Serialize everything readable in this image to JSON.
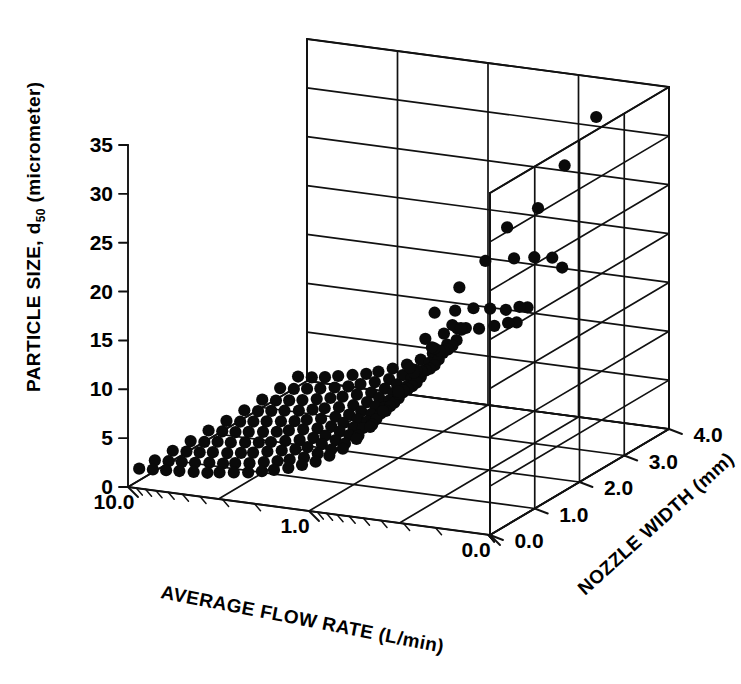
{
  "figure": {
    "background_color": "#ffffff",
    "ink_color": "#000000",
    "marker_color": "#0a0a0a"
  },
  "chart_data": {
    "type": "scatter",
    "projection": "3d",
    "title": "",
    "subtitle": "",
    "xlabel": "AVERAGE FLOW RATE (L/min)",
    "ylabel": "NOZZLE WIDTH (mm)",
    "zlabel_parts": {
      "prefix": "PARTICLE SIZE, d",
      "subscript": "50",
      "suffix": " (micrometer)"
    },
    "zlabel": "PARTICLE SIZE, d50 (micrometer)",
    "xscale": "log",
    "yscale": "linear",
    "zscale": "linear",
    "xlim": [
      0.0,
      10.0
    ],
    "ylim": [
      0.0,
      4.0
    ],
    "zlim": [
      0,
      35
    ],
    "xticks": [
      "10.0",
      "1.0",
      "0.0"
    ],
    "xtick_values": [
      10.0,
      1.0,
      0.0
    ],
    "yticks": [
      "0.0",
      "1.0",
      "2.0",
      "3.0",
      "4.0"
    ],
    "ytick_values": [
      0.0,
      1.0,
      2.0,
      3.0,
      4.0
    ],
    "zticks": [
      "0",
      "5",
      "10",
      "15",
      "20",
      "25",
      "30",
      "35"
    ],
    "ztick_values": [
      0,
      5,
      10,
      15,
      20,
      25,
      30,
      35
    ],
    "grid": true,
    "legend": "none",
    "annotations": [],
    "series": [
      {
        "name": "measured particle size",
        "marker": "filled-circle",
        "color": "#0a0a0a",
        "note": "Particle size d50 rises sharply as average flow rate decreases; spread increases with lower flow rate and varies with nozzle width.",
        "points": [
          {
            "x": 10.0,
            "y": 0.25,
            "z": 1.2
          },
          {
            "x": 8.4,
            "y": 0.25,
            "z": 1.3
          },
          {
            "x": 7.1,
            "y": 0.25,
            "z": 1.4
          },
          {
            "x": 6.0,
            "y": 0.25,
            "z": 1.5
          },
          {
            "x": 5.0,
            "y": 0.25,
            "z": 1.6
          },
          {
            "x": 4.2,
            "y": 0.25,
            "z": 1.7
          },
          {
            "x": 3.6,
            "y": 0.25,
            "z": 1.9
          },
          {
            "x": 3.0,
            "y": 0.25,
            "z": 2.1
          },
          {
            "x": 2.5,
            "y": 0.25,
            "z": 2.3
          },
          {
            "x": 2.1,
            "y": 0.25,
            "z": 2.6
          },
          {
            "x": 1.8,
            "y": 0.25,
            "z": 2.9
          },
          {
            "x": 1.5,
            "y": 0.25,
            "z": 3.3
          },
          {
            "x": 1.26,
            "y": 0.25,
            "z": 3.8
          },
          {
            "x": 1.06,
            "y": 0.25,
            "z": 4.3
          },
          {
            "x": 0.89,
            "y": 0.25,
            "z": 5.1
          },
          {
            "x": 0.75,
            "y": 0.25,
            "z": 6.0
          },
          {
            "x": 0.63,
            "y": 0.25,
            "z": 7.2
          },
          {
            "x": 0.53,
            "y": 0.25,
            "z": 8.6
          },
          {
            "x": 0.45,
            "y": 0.25,
            "z": 10.4
          },
          {
            "x": 0.37,
            "y": 0.25,
            "z": 12.6
          },
          {
            "x": 0.32,
            "y": 0.25,
            "z": 15.2
          },
          {
            "x": 10.0,
            "y": 0.6,
            "z": 1.1
          },
          {
            "x": 8.4,
            "y": 0.6,
            "z": 1.2
          },
          {
            "x": 7.1,
            "y": 0.6,
            "z": 1.3
          },
          {
            "x": 6.0,
            "y": 0.6,
            "z": 1.4
          },
          {
            "x": 5.0,
            "y": 0.6,
            "z": 1.6
          },
          {
            "x": 4.2,
            "y": 0.6,
            "z": 1.7
          },
          {
            "x": 3.6,
            "y": 0.6,
            "z": 1.9
          },
          {
            "x": 3.0,
            "y": 0.6,
            "z": 2.1
          },
          {
            "x": 2.5,
            "y": 0.6,
            "z": 2.4
          },
          {
            "x": 2.1,
            "y": 0.6,
            "z": 2.7
          },
          {
            "x": 1.8,
            "y": 0.6,
            "z": 3.0
          },
          {
            "x": 1.5,
            "y": 0.6,
            "z": 3.4
          },
          {
            "x": 1.26,
            "y": 0.6,
            "z": 4.0
          },
          {
            "x": 1.06,
            "y": 0.6,
            "z": 4.6
          },
          {
            "x": 0.89,
            "y": 0.6,
            "z": 5.4
          },
          {
            "x": 0.75,
            "y": 0.6,
            "z": 6.4
          },
          {
            "x": 0.63,
            "y": 0.6,
            "z": 7.7
          },
          {
            "x": 0.53,
            "y": 0.6,
            "z": 9.3
          },
          {
            "x": 0.45,
            "y": 0.6,
            "z": 11.2
          },
          {
            "x": 0.37,
            "y": 0.6,
            "z": 13.6
          },
          {
            "x": 10.0,
            "y": 1.0,
            "z": 1.0
          },
          {
            "x": 8.4,
            "y": 1.0,
            "z": 1.1
          },
          {
            "x": 7.1,
            "y": 1.0,
            "z": 1.2
          },
          {
            "x": 6.0,
            "y": 1.0,
            "z": 1.4
          },
          {
            "x": 5.0,
            "y": 1.0,
            "z": 1.5
          },
          {
            "x": 4.2,
            "y": 1.0,
            "z": 1.7
          },
          {
            "x": 3.6,
            "y": 1.0,
            "z": 1.9
          },
          {
            "x": 3.0,
            "y": 1.0,
            "z": 2.2
          },
          {
            "x": 2.5,
            "y": 1.0,
            "z": 2.5
          },
          {
            "x": 2.1,
            "y": 1.0,
            "z": 2.8
          },
          {
            "x": 1.8,
            "y": 1.0,
            "z": 3.2
          },
          {
            "x": 1.5,
            "y": 1.0,
            "z": 3.7
          },
          {
            "x": 1.26,
            "y": 1.0,
            "z": 4.3
          },
          {
            "x": 1.06,
            "y": 1.0,
            "z": 5.0
          },
          {
            "x": 0.89,
            "y": 1.0,
            "z": 5.9
          },
          {
            "x": 0.75,
            "y": 1.0,
            "z": 7.0
          },
          {
            "x": 0.63,
            "y": 1.0,
            "z": 8.5
          },
          {
            "x": 0.53,
            "y": 1.0,
            "z": 10.3
          },
          {
            "x": 0.45,
            "y": 1.0,
            "z": 12.5
          },
          {
            "x": 0.37,
            "y": 1.0,
            "z": 15.1
          },
          {
            "x": 10.0,
            "y": 1.4,
            "z": 0.9
          },
          {
            "x": 8.4,
            "y": 1.4,
            "z": 1.0
          },
          {
            "x": 7.1,
            "y": 1.4,
            "z": 1.2
          },
          {
            "x": 6.0,
            "y": 1.4,
            "z": 1.3
          },
          {
            "x": 5.0,
            "y": 1.4,
            "z": 1.5
          },
          {
            "x": 4.2,
            "y": 1.4,
            "z": 1.7
          },
          {
            "x": 3.6,
            "y": 1.4,
            "z": 1.9
          },
          {
            "x": 3.0,
            "y": 1.4,
            "z": 2.2
          },
          {
            "x": 2.5,
            "y": 1.4,
            "z": 2.5
          },
          {
            "x": 2.1,
            "y": 1.4,
            "z": 2.9
          },
          {
            "x": 1.8,
            "y": 1.4,
            "z": 3.3
          },
          {
            "x": 1.5,
            "y": 1.4,
            "z": 3.9
          },
          {
            "x": 1.26,
            "y": 1.4,
            "z": 4.5
          },
          {
            "x": 1.06,
            "y": 1.4,
            "z": 5.3
          },
          {
            "x": 0.89,
            "y": 1.4,
            "z": 6.3
          },
          {
            "x": 0.75,
            "y": 1.4,
            "z": 7.6
          },
          {
            "x": 0.63,
            "y": 1.4,
            "z": 9.2
          },
          {
            "x": 0.53,
            "y": 1.4,
            "z": 11.2
          },
          {
            "x": 0.45,
            "y": 1.4,
            "z": 13.7
          },
          {
            "x": 10.0,
            "y": 1.8,
            "z": 0.9
          },
          {
            "x": 8.4,
            "y": 1.8,
            "z": 1.0
          },
          {
            "x": 7.1,
            "y": 1.8,
            "z": 1.1
          },
          {
            "x": 6.0,
            "y": 1.8,
            "z": 1.3
          },
          {
            "x": 5.0,
            "y": 1.8,
            "z": 1.5
          },
          {
            "x": 4.2,
            "y": 1.8,
            "z": 1.7
          },
          {
            "x": 3.6,
            "y": 1.8,
            "z": 2.0
          },
          {
            "x": 3.0,
            "y": 1.8,
            "z": 2.3
          },
          {
            "x": 2.5,
            "y": 1.8,
            "z": 2.6
          },
          {
            "x": 2.1,
            "y": 1.8,
            "z": 3.0
          },
          {
            "x": 1.8,
            "y": 1.8,
            "z": 3.5
          },
          {
            "x": 1.5,
            "y": 1.8,
            "z": 4.1
          },
          {
            "x": 1.26,
            "y": 1.8,
            "z": 4.8
          },
          {
            "x": 1.06,
            "y": 1.8,
            "z": 5.7
          },
          {
            "x": 0.89,
            "y": 1.8,
            "z": 6.8
          },
          {
            "x": 0.75,
            "y": 1.8,
            "z": 8.2
          },
          {
            "x": 0.63,
            "y": 1.8,
            "z": 10.0
          },
          {
            "x": 0.53,
            "y": 1.8,
            "z": 12.2
          },
          {
            "x": 0.45,
            "y": 1.8,
            "z": 15.0
          },
          {
            "x": 10.0,
            "y": 2.2,
            "z": 0.8
          },
          {
            "x": 8.4,
            "y": 2.2,
            "z": 0.9
          },
          {
            "x": 7.1,
            "y": 2.2,
            "z": 1.1
          },
          {
            "x": 6.0,
            "y": 2.2,
            "z": 1.3
          },
          {
            "x": 5.0,
            "y": 2.2,
            "z": 1.5
          },
          {
            "x": 4.2,
            "y": 2.2,
            "z": 1.7
          },
          {
            "x": 3.6,
            "y": 2.2,
            "z": 2.0
          },
          {
            "x": 3.0,
            "y": 2.2,
            "z": 2.3
          },
          {
            "x": 2.5,
            "y": 2.2,
            "z": 2.7
          },
          {
            "x": 2.1,
            "y": 2.2,
            "z": 3.1
          },
          {
            "x": 1.8,
            "y": 2.2,
            "z": 3.6
          },
          {
            "x": 1.5,
            "y": 2.2,
            "z": 4.3
          },
          {
            "x": 1.26,
            "y": 2.2,
            "z": 5.1
          },
          {
            "x": 1.06,
            "y": 2.2,
            "z": 6.1
          },
          {
            "x": 0.89,
            "y": 2.2,
            "z": 7.3
          },
          {
            "x": 0.75,
            "y": 2.2,
            "z": 8.9
          },
          {
            "x": 0.63,
            "y": 2.2,
            "z": 10.9
          },
          {
            "x": 0.53,
            "y": 2.2,
            "z": 13.4
          },
          {
            "x": 10.0,
            "y": 2.6,
            "z": 0.8
          },
          {
            "x": 8.4,
            "y": 2.6,
            "z": 0.9
          },
          {
            "x": 7.1,
            "y": 2.6,
            "z": 1.1
          },
          {
            "x": 6.0,
            "y": 2.6,
            "z": 1.3
          },
          {
            "x": 5.0,
            "y": 2.6,
            "z": 1.5
          },
          {
            "x": 4.2,
            "y": 2.6,
            "z": 1.8
          },
          {
            "x": 3.6,
            "y": 2.6,
            "z": 2.1
          },
          {
            "x": 3.0,
            "y": 2.6,
            "z": 2.4
          },
          {
            "x": 2.5,
            "y": 2.6,
            "z": 2.8
          },
          {
            "x": 2.1,
            "y": 2.6,
            "z": 3.3
          },
          {
            "x": 1.8,
            "y": 2.6,
            "z": 3.9
          },
          {
            "x": 1.5,
            "y": 2.6,
            "z": 4.6
          },
          {
            "x": 1.26,
            "y": 2.6,
            "z": 5.5
          },
          {
            "x": 1.06,
            "y": 2.6,
            "z": 6.6
          },
          {
            "x": 0.89,
            "y": 2.6,
            "z": 8.0
          },
          {
            "x": 0.75,
            "y": 2.6,
            "z": 9.8
          },
          {
            "x": 0.63,
            "y": 2.6,
            "z": 12.0
          },
          {
            "x": 10.0,
            "y": 3.0,
            "z": 0.8
          },
          {
            "x": 8.4,
            "y": 3.0,
            "z": 0.9
          },
          {
            "x": 7.1,
            "y": 3.0,
            "z": 1.1
          },
          {
            "x": 6.0,
            "y": 3.0,
            "z": 1.3
          },
          {
            "x": 5.0,
            "y": 3.0,
            "z": 1.6
          },
          {
            "x": 4.2,
            "y": 3.0,
            "z": 1.9
          },
          {
            "x": 3.6,
            "y": 3.0,
            "z": 2.2
          },
          {
            "x": 3.0,
            "y": 3.0,
            "z": 2.6
          },
          {
            "x": 2.5,
            "y": 3.0,
            "z": 3.0
          },
          {
            "x": 2.1,
            "y": 3.0,
            "z": 3.6
          },
          {
            "x": 1.8,
            "y": 3.0,
            "z": 4.2
          },
          {
            "x": 1.5,
            "y": 3.0,
            "z": 5.0
          },
          {
            "x": 1.26,
            "y": 3.0,
            "z": 6.0
          },
          {
            "x": 1.06,
            "y": 3.0,
            "z": 7.3
          },
          {
            "x": 0.89,
            "y": 3.0,
            "z": 8.9
          },
          {
            "x": 0.75,
            "y": 3.0,
            "z": 10.9
          },
          {
            "x": 10.0,
            "y": 3.4,
            "z": 0.9
          },
          {
            "x": 8.4,
            "y": 3.4,
            "z": 1.0
          },
          {
            "x": 7.1,
            "y": 3.4,
            "z": 1.2
          },
          {
            "x": 6.0,
            "y": 3.4,
            "z": 1.4
          },
          {
            "x": 5.0,
            "y": 3.4,
            "z": 1.7
          },
          {
            "x": 4.2,
            "y": 3.4,
            "z": 2.0
          },
          {
            "x": 3.6,
            "y": 3.4,
            "z": 2.4
          },
          {
            "x": 3.0,
            "y": 3.4,
            "z": 2.8
          },
          {
            "x": 2.5,
            "y": 3.4,
            "z": 3.3
          },
          {
            "x": 2.1,
            "y": 3.4,
            "z": 3.9
          },
          {
            "x": 1.8,
            "y": 3.4,
            "z": 4.6
          },
          {
            "x": 1.5,
            "y": 3.4,
            "z": 5.5
          },
          {
            "x": 1.26,
            "y": 3.4,
            "z": 6.7
          },
          {
            "x": 1.06,
            "y": 3.4,
            "z": 8.2
          },
          {
            "x": 10.0,
            "y": 3.8,
            "z": 1.0
          },
          {
            "x": 8.4,
            "y": 3.8,
            "z": 1.1
          },
          {
            "x": 7.1,
            "y": 3.8,
            "z": 1.3
          },
          {
            "x": 6.0,
            "y": 3.8,
            "z": 1.6
          },
          {
            "x": 5.0,
            "y": 3.8,
            "z": 1.9
          },
          {
            "x": 4.2,
            "y": 3.8,
            "z": 2.2
          },
          {
            "x": 3.6,
            "y": 3.8,
            "z": 2.6
          },
          {
            "x": 3.0,
            "y": 3.8,
            "z": 3.1
          },
          {
            "x": 2.5,
            "y": 3.8,
            "z": 3.7
          },
          {
            "x": 2.1,
            "y": 3.8,
            "z": 4.4
          },
          {
            "x": 1.8,
            "y": 3.8,
            "z": 5.2
          },
          {
            "x": 1.5,
            "y": 3.8,
            "z": 6.3
          },
          {
            "x": 0.27,
            "y": 0.3,
            "z": 18.2
          },
          {
            "x": 0.24,
            "y": 0.3,
            "z": 21.0
          },
          {
            "x": 0.3,
            "y": 0.9,
            "z": 17.0
          },
          {
            "x": 0.26,
            "y": 0.9,
            "z": 19.5
          },
          {
            "x": 0.34,
            "y": 1.5,
            "z": 15.8
          },
          {
            "x": 0.29,
            "y": 1.5,
            "z": 18.0
          },
          {
            "x": 0.38,
            "y": 2.1,
            "z": 14.0
          },
          {
            "x": 0.33,
            "y": 2.1,
            "z": 16.2
          },
          {
            "x": 0.44,
            "y": 2.7,
            "z": 12.5
          },
          {
            "x": 0.38,
            "y": 2.7,
            "z": 14.3
          },
          {
            "x": 0.52,
            "y": 3.3,
            "z": 11.0
          },
          {
            "x": 0.45,
            "y": 3.3,
            "z": 12.8
          },
          {
            "x": 0.62,
            "y": 3.8,
            "z": 9.5
          },
          {
            "x": 0.54,
            "y": 3.8,
            "z": 11.2
          },
          {
            "x": 0.21,
            "y": 1.2,
            "z": 24.0
          },
          {
            "x": 0.2,
            "y": 1.6,
            "z": 26.4
          },
          {
            "x": 0.19,
            "y": 2.2,
            "z": 26.8
          },
          {
            "x": 0.17,
            "y": 2.6,
            "z": 30.2
          },
          {
            "x": 0.16,
            "y": 3.2,
            "z": 33.6
          },
          {
            "x": 0.23,
            "y": 2.0,
            "z": 22.0
          },
          {
            "x": 0.25,
            "y": 2.6,
            "z": 20.4
          },
          {
            "x": 0.28,
            "y": 3.2,
            "z": 18.6
          },
          {
            "x": 0.22,
            "y": 0.7,
            "z": 22.6
          },
          {
            "x": 0.31,
            "y": 3.6,
            "z": 16.4
          }
        ]
      }
    ]
  }
}
